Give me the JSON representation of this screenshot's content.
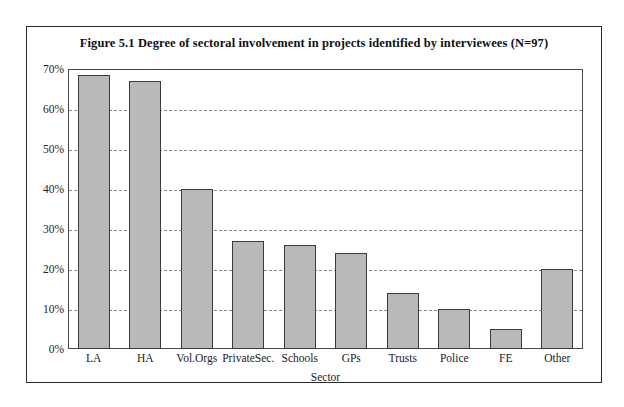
{
  "chart_data": {
    "type": "bar",
    "title": "Figure 5.1 Degree of sectoral involvement in projects identified by interviewees (N=97)",
    "xlabel": "Sector",
    "ylabel": "",
    "categories": [
      "LA",
      "HA",
      "Vol.Orgs",
      "PrivateSec.",
      "Schools",
      "GPs",
      "Trusts",
      "Police",
      "FE",
      "Other"
    ],
    "values": [
      68.5,
      67,
      40,
      27,
      26,
      24,
      14,
      10,
      5,
      20
    ],
    "ylim": [
      0,
      70
    ],
    "ytick_values": [
      0,
      10,
      20,
      30,
      40,
      50,
      60,
      70
    ],
    "ytick_labels": [
      "0%",
      "10%",
      "20%",
      "30%",
      "40%",
      "50%",
      "60%",
      "70%"
    ],
    "grid": true,
    "grid_axis": "y",
    "grid_style": "dashed",
    "legend": false,
    "bar_color": "#b9b9b9",
    "bar_edge_color": "#3b3b3b",
    "grid_color": "#8c8c8c",
    "axis_color": "#4a4a4a",
    "frame_color": "#2a2a2a",
    "text_color": "#222222"
  }
}
